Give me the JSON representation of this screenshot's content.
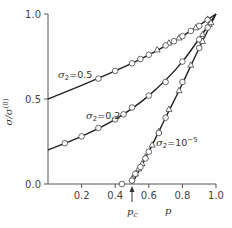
{
  "chart_data": {
    "type": "line",
    "title": "",
    "xlabel": "p",
    "ylabel": "σ/σ(0)",
    "xlim": [
      0.0,
      1.0
    ],
    "ylim": [
      0.0,
      1.0
    ],
    "x_ticks": [
      "0.2",
      "0.4",
      "0.6",
      "0.8",
      "1.0"
    ],
    "y_ticks": [
      "0.0",
      "0.5",
      "1.0"
    ],
    "grid": false,
    "legend": "none (inline curve labels)",
    "annotations": [
      {
        "text": "p_c",
        "x": 0.5,
        "arrow": true,
        "description": "percolation threshold marker"
      }
    ],
    "series": [
      {
        "name": "σ2=0.5",
        "label": "σ2=0.5",
        "curve": {
          "x": [
            0.0,
            0.2,
            0.4,
            0.6,
            0.8,
            1.0
          ],
          "y": [
            0.5,
            0.58,
            0.665,
            0.76,
            0.87,
            1.0
          ]
        },
        "markers_circle": {
          "x": [
            0.3,
            0.4,
            0.5,
            0.55,
            0.6,
            0.7,
            0.75,
            0.8,
            0.85,
            0.9,
            0.95
          ],
          "y": [
            0.62,
            0.665,
            0.71,
            0.735,
            0.76,
            0.815,
            0.84,
            0.87,
            0.9,
            0.93,
            0.965
          ]
        },
        "markers_triangle": {
          "x": [
            0.65,
            0.72,
            0.78,
            0.88,
            0.95
          ],
          "y": [
            0.79,
            0.83,
            0.86,
            0.92,
            0.97
          ]
        }
      },
      {
        "name": "σ2=0.2",
        "label": "σ2=0.2",
        "curve": {
          "x": [
            0.0,
            0.2,
            0.4,
            0.6,
            0.8,
            1.0
          ],
          "y": [
            0.2,
            0.28,
            0.38,
            0.52,
            0.72,
            1.0
          ]
        },
        "markers_circle": {
          "x": [
            0.1,
            0.2,
            0.3,
            0.4,
            0.45,
            0.5,
            0.6,
            0.7,
            0.8,
            0.9,
            0.95
          ],
          "y": [
            0.24,
            0.28,
            0.33,
            0.38,
            0.41,
            0.45,
            0.52,
            0.6,
            0.72,
            0.85,
            0.92
          ]
        },
        "markers_triangle": {
          "x": [
            0.92,
            0.96
          ],
          "y": [
            0.88,
            0.94
          ]
        }
      },
      {
        "name": "σ2=10^-5",
        "label": "σ2=10⁻⁵",
        "curve": {
          "x": [
            0.5,
            0.6,
            0.7,
            0.8,
            0.9,
            1.0
          ],
          "y": [
            0.0,
            0.19,
            0.39,
            0.59,
            0.8,
            1.0
          ]
        },
        "markers_circle": {
          "x": [
            0.44,
            0.5,
            0.52,
            0.55,
            0.58,
            0.6,
            0.66,
            0.7,
            0.8,
            0.9
          ],
          "y": [
            0.0,
            0.02,
            0.06,
            0.1,
            0.15,
            0.19,
            0.3,
            0.39,
            0.6,
            0.8
          ]
        },
        "markers_triangle": {
          "x": [
            0.5,
            0.52,
            0.54,
            0.56,
            0.58,
            0.62,
            0.66,
            0.72,
            0.78,
            0.85,
            0.92,
            0.97
          ],
          "y": [
            0.03,
            0.06,
            0.09,
            0.12,
            0.16,
            0.23,
            0.31,
            0.44,
            0.55,
            0.7,
            0.84,
            0.95
          ]
        }
      }
    ]
  },
  "labels": {
    "y_axis": "σ/σ",
    "y_axis_sup": "(0)",
    "x_axis": "p",
    "pc": "p",
    "pc_sub": "c",
    "curve_05": "=0.5",
    "curve_02": "=0.2",
    "curve_1e5": "=10",
    "curve_1e5_sup": "−5",
    "sigma": "σ",
    "sigma_sub": "2"
  },
  "ticks": {
    "x": [
      "0.2",
      "0.4",
      "0.6",
      "0.8",
      "1.0"
    ],
    "y": [
      "0.0",
      "0.5",
      "1.0"
    ]
  }
}
